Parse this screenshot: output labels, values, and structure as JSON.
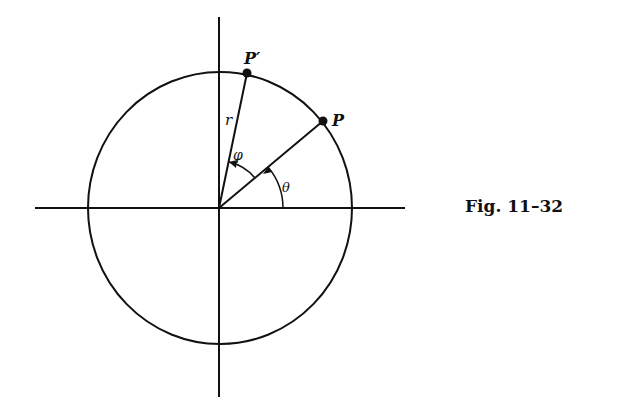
{
  "diagram": {
    "caption": "Fig. 11–32",
    "labels": {
      "point_p": "P",
      "point_p_prime": "P′",
      "radius": "r",
      "angle_phi": "φ",
      "angle_theta": "θ"
    },
    "geometry": {
      "center": [
        220,
        208
      ],
      "radius": 134,
      "axes": {
        "horizontal": {
          "x1": 35,
          "x2": 405,
          "y": 208
        },
        "vertical": {
          "x": 219,
          "y1": 17,
          "y2": 397
        }
      },
      "point_p": [
        323,
        121
      ],
      "point_p_prime": [
        247,
        73
      ]
    },
    "colors": {
      "ink": "#111111",
      "background": "#ffffff"
    }
  }
}
